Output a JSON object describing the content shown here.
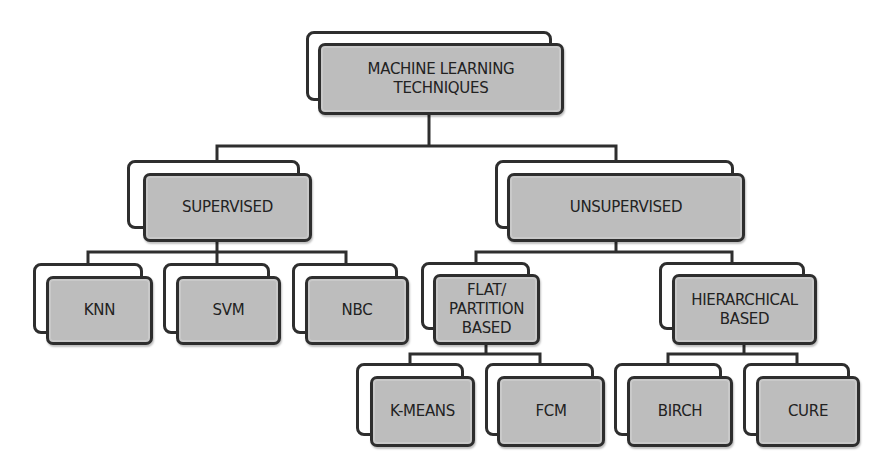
{
  "diagram": {
    "colors": {
      "box_fill": "#bdbdbd",
      "border": "#2e2e2e",
      "back_fill": "#ffffff",
      "text": "#222222"
    },
    "nodes": {
      "root": {
        "label": "MACHINE LEARNING\nTECHNIQUES"
      },
      "supervised": {
        "label": "SUPERVISED"
      },
      "unsupervised": {
        "label": "UNSUPERVISED"
      },
      "knn": {
        "label": "KNN"
      },
      "svm": {
        "label": "SVM"
      },
      "nbc": {
        "label": "NBC"
      },
      "flat": {
        "label": "FLAT/\nPARTITION\nBASED"
      },
      "hierarchical": {
        "label": "HIERARCHICAL\nBASED"
      },
      "kmeans": {
        "label": "K-MEANS"
      },
      "fcm": {
        "label": "FCM"
      },
      "birch": {
        "label": "BIRCH"
      },
      "cure": {
        "label": "CURE"
      }
    },
    "edges": [
      [
        "root",
        "supervised"
      ],
      [
        "root",
        "unsupervised"
      ],
      [
        "supervised",
        "knn"
      ],
      [
        "supervised",
        "svm"
      ],
      [
        "supervised",
        "nbc"
      ],
      [
        "unsupervised",
        "flat"
      ],
      [
        "unsupervised",
        "hierarchical"
      ],
      [
        "flat",
        "kmeans"
      ],
      [
        "flat",
        "fcm"
      ],
      [
        "hierarchical",
        "birch"
      ],
      [
        "hierarchical",
        "cure"
      ]
    ]
  }
}
